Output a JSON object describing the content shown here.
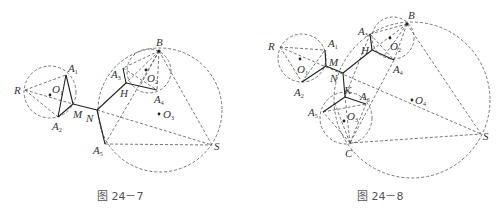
{
  "figures": [
    {
      "id": "fig-24-7",
      "caption": "图 24－7",
      "points": {
        "R": "R",
        "O1": "O",
        "O1_sub": "1",
        "A1": "A",
        "A1_sub": "1",
        "A2": "A",
        "A2_sub": "2",
        "M": "M",
        "N": "N",
        "H": "H",
        "A3": "A",
        "A3_sub": "3",
        "B": "B",
        "O2": "O",
        "O2_sub": "2",
        "A4": "A",
        "A4_sub": "4",
        "O3": "O",
        "O3_sub": "3",
        "A5": "A",
        "A5_sub": "5",
        "S": "S"
      }
    },
    {
      "id": "fig-24-8",
      "caption": "图 24－8",
      "points": {
        "R": "R",
        "O1": "O",
        "O1_sub": "1",
        "A1": "A",
        "A1_sub": "1",
        "A2": "A",
        "A2_sub": "2",
        "M": "M",
        "N": "N",
        "H": "H",
        "A3": "A",
        "A3_sub": "3",
        "B": "B",
        "O2": "O",
        "O2_sub": "2",
        "A4": "A",
        "A4_sub": "4",
        "K": "K",
        "A5": "A",
        "A5_sub": "5",
        "A6": "A",
        "A6_sub": "6",
        "O3": "O",
        "O3_sub": "3",
        "C": "C",
        "O4": "O",
        "O4_sub": "4",
        "S": "S"
      }
    }
  ]
}
